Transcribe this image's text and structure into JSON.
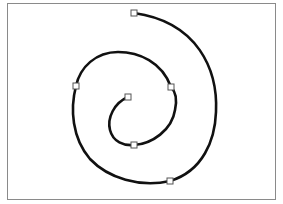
{
  "canvas": {
    "frame": {
      "x": 7,
      "y": 3,
      "width": 269,
      "height": 197,
      "border_color": "#8a8a8a"
    },
    "spiral": {
      "stroke_color": "#111111",
      "stroke_width": 2.6,
      "path": "M128,97 C114,103 107,118 110,130 C113,142 124,146 134,145 C152,144 172,130 175,110 C178,96 174,90 171,87 C162,62 139,52 118,52 C96,52 80,67 76,86 C70,109 72,138 90,159 C108,178 140,188 170,181 C203,171 215,140 216,112 C218,70 198,22 134,13"
    },
    "handles": [
      {
        "name": "handle-center",
        "x": 128,
        "y": 97
      },
      {
        "name": "handle-inner-bottom",
        "x": 134,
        "y": 145
      },
      {
        "name": "handle-inner-right",
        "x": 171,
        "y": 87
      },
      {
        "name": "handle-left",
        "x": 76,
        "y": 86
      },
      {
        "name": "handle-bottom-right",
        "x": 170,
        "y": 181
      },
      {
        "name": "handle-top",
        "x": 134,
        "y": 13
      }
    ],
    "handle_size": 6,
    "handle_fill": "#ffffff",
    "handle_stroke": "#555555"
  }
}
